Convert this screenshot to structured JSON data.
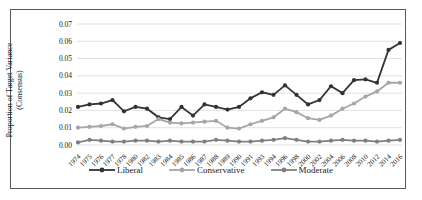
{
  "chart_data": {
    "type": "line",
    "title": "",
    "ylabel_line1": "Proportion of Target Variance",
    "ylabel_line2": "(Consensus)",
    "xlabel": "",
    "x_categories": [
      "1974",
      "1975",
      "1976",
      "1977",
      "1978",
      "1980",
      "1982",
      "1983",
      "1984",
      "1985",
      "1986",
      "1987",
      "1988",
      "1989",
      "1990",
      "1991",
      "1993",
      "1994",
      "1996",
      "1998",
      "2000",
      "2002",
      "2004",
      "2006",
      "2008",
      "2010",
      "2012",
      "2014",
      "2016"
    ],
    "y_ticks": [
      "0.00",
      "0.01",
      "0.02",
      "0.03",
      "0.04",
      "0.05",
      "0.06",
      "0.07"
    ],
    "ylim": [
      0,
      0.07
    ],
    "grid": "horizontal",
    "gridline_color": "#d9d9d9",
    "legend_position": "bottom",
    "series": [
      {
        "name": "Liberal",
        "color": "#333333",
        "values": [
          0.022,
          0.0235,
          0.024,
          0.026,
          0.0195,
          0.022,
          0.021,
          0.016,
          0.015,
          0.022,
          0.017,
          0.0235,
          0.022,
          0.0205,
          0.022,
          0.027,
          0.0305,
          0.029,
          0.0345,
          0.029,
          0.0235,
          0.026,
          0.034,
          0.03,
          0.0375,
          0.038,
          0.036,
          0.055,
          0.059
        ]
      },
      {
        "name": "Conservative",
        "color": "#a6a6a6",
        "values": [
          0.01,
          0.0105,
          0.011,
          0.012,
          0.0095,
          0.0105,
          0.011,
          0.015,
          0.013,
          0.0125,
          0.013,
          0.0135,
          0.014,
          0.01,
          0.0095,
          0.012,
          0.014,
          0.016,
          0.021,
          0.019,
          0.0155,
          0.0145,
          0.017,
          0.021,
          0.024,
          0.028,
          0.031,
          0.036,
          0.036
        ]
      },
      {
        "name": "Moderate",
        "color": "#7f7f7f",
        "values": [
          0.0015,
          0.003,
          0.0025,
          0.002,
          0.002,
          0.0025,
          0.0025,
          0.002,
          0.0025,
          0.002,
          0.002,
          0.002,
          0.003,
          0.0025,
          0.002,
          0.002,
          0.0025,
          0.003,
          0.004,
          0.003,
          0.002,
          0.002,
          0.0025,
          0.003,
          0.0025,
          0.0025,
          0.002,
          0.0025,
          0.003
        ]
      }
    ]
  }
}
